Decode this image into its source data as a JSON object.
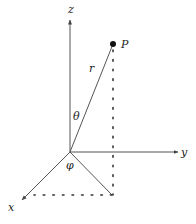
{
  "diagram": {
    "labels": {
      "z_axis": "z",
      "y_axis": "y",
      "x_axis": "x",
      "point": "P",
      "radius": "r",
      "polar_angle": "θ",
      "azimuth_angle": "φ"
    },
    "colors": {
      "line": "#444444",
      "text": "#222222",
      "background": "#ffffff"
    },
    "geometry": {
      "origin": [
        70,
        152
      ],
      "z_axis_end": [
        70,
        20
      ],
      "y_axis_end": [
        178,
        152
      ],
      "x_axis_end": [
        22,
        200
      ],
      "point_P": [
        113,
        44
      ],
      "projection_foot": [
        112,
        195
      ]
    }
  }
}
